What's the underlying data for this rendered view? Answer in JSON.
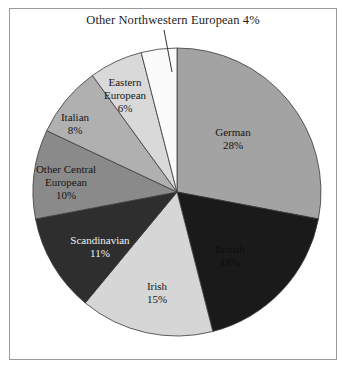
{
  "figure": {
    "callout_label": "Other Northwestern European 4%",
    "background_color": "#ffffff",
    "frame_color": "#9a9a9a"
  },
  "chart_data": {
    "type": "pie",
    "title": "",
    "annotations": [
      "Other Northwestern European 4%"
    ],
    "legend_position": "none",
    "labels_inside_slices": true,
    "categories": [
      "German",
      "British",
      "Irish",
      "Scandinavian",
      "Other Central European",
      "Italian",
      "Eastern European",
      "Other Northwestern European"
    ],
    "values": [
      28,
      18,
      15,
      11,
      10,
      8,
      6,
      4
    ],
    "unit": "%",
    "slices": [
      {
        "name": "German",
        "value": 28,
        "label": "German",
        "pct": "28%",
        "color": "#a3a3a3",
        "text_color": "#161616"
      },
      {
        "name": "British",
        "value": 18,
        "label": "British",
        "pct": "18%",
        "color": "#1a1a1a",
        "text_color": "#0d0d0d"
      },
      {
        "name": "Irish",
        "value": 15,
        "label": "Irish",
        "pct": "15%",
        "color": "#d6d6d6",
        "text_color": "#161616"
      },
      {
        "name": "Scandinavian",
        "value": 11,
        "label": "Scandinavian",
        "pct": "11%",
        "color": "#2e2e2e",
        "text_color": "#f2f2f2"
      },
      {
        "name": "Other Central European",
        "value": 10,
        "label": "Other Central",
        "pct": "10%",
        "label2": "European",
        "color": "#8a8a8a",
        "text_color": "#161616"
      },
      {
        "name": "Italian",
        "value": 8,
        "label": "Italian",
        "pct": "8%",
        "color": "#b0b0b0",
        "text_color": "#161616"
      },
      {
        "name": "Eastern European",
        "value": 6,
        "label": "Eastern",
        "pct": "6%",
        "label2": "European",
        "color": "#d9d9d9",
        "text_color": "#161616"
      },
      {
        "name": "Other Northwestern European",
        "value": 4,
        "label": "Other Northwestern European",
        "pct": "4%",
        "color": "#fbfbfb",
        "text_color": "#161616"
      }
    ]
  }
}
